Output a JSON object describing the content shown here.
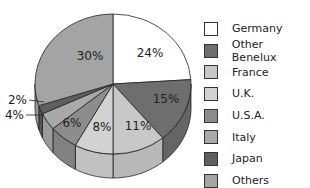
{
  "chart_data": {
    "type": "pie",
    "style": "3d",
    "title": "",
    "categories": [
      "Germany",
      "Other Benelux",
      "France",
      "U.K.",
      "U.S.A.",
      "Italy",
      "Japan",
      "Others"
    ],
    "values": [
      24,
      15,
      11,
      8,
      6,
      4,
      2,
      30
    ],
    "labels": [
      "24%",
      "15%",
      "11%",
      "8%",
      "6%",
      "4%",
      "2%",
      "30%"
    ],
    "colors": [
      "#ffffff",
      "#6e6e6e",
      "#c8c8c8",
      "#d2d2d2",
      "#8c8c8c",
      "#a9a9a9",
      "#5f5f5f",
      "#a4a4a4"
    ],
    "legend_position": "right"
  },
  "legend": {
    "items": [
      {
        "label": "Germany",
        "color": "#ffffff"
      },
      {
        "label": "Other Benelux",
        "color": "#6e6e6e"
      },
      {
        "label": "France",
        "color": "#c8c8c8"
      },
      {
        "label": "U.K.",
        "color": "#d2d2d2"
      },
      {
        "label": "U.S.A.",
        "color": "#8c8c8c"
      },
      {
        "label": "Italy",
        "color": "#a9a9a9"
      },
      {
        "label": "Japan",
        "color": "#5f5f5f"
      },
      {
        "label": "Others",
        "color": "#a4a4a4"
      }
    ]
  }
}
